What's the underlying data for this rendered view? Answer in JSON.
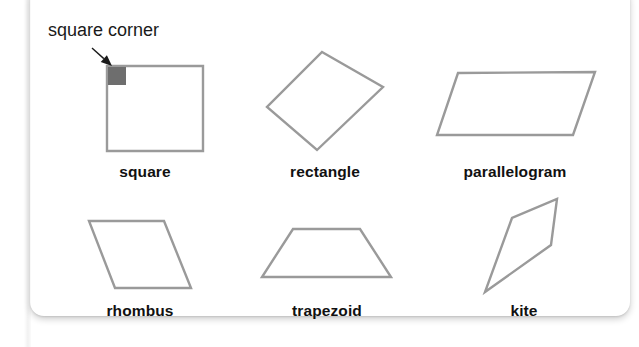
{
  "page": {
    "background_color": "#ffffff",
    "card_color": "#ffffff"
  },
  "style": {
    "shape_stroke_color": "#9a9a9a",
    "shape_fill_color": "#ffffff",
    "corner_marker_color": "#6e6e6e",
    "label_color": "#111111",
    "annotation_color": "#1a1a1a"
  },
  "annotation": {
    "text": "square corner",
    "x": 48,
    "y": 20,
    "arrow_start_x": 92,
    "arrow_start_y": 48,
    "arrow_end_x": 112,
    "arrow_end_y": 66
  },
  "shapes": [
    {
      "id": "square",
      "label": "square",
      "label_x": 145,
      "label_y": 163,
      "points": "107,66 203,66 203,151 107,151",
      "has_corner_marker": true,
      "corner_marker": {
        "x": 108,
        "y": 67,
        "width": 18,
        "height": 18
      }
    },
    {
      "id": "rectangle",
      "label": "rectangle",
      "label_x": 325,
      "label_y": 163,
      "points": "322,52 383,87 317,150 267,107",
      "has_corner_marker": false
    },
    {
      "id": "parallelogram",
      "label": "parallelogram",
      "label_x": 515,
      "label_y": 163,
      "points": "458,73 595,72 573,135 437,135",
      "has_corner_marker": false
    },
    {
      "id": "rhombus",
      "label": "rhombus",
      "label_x": 140,
      "label_y": 302,
      "points": "89,221 164,221 191,288 115,288",
      "has_corner_marker": false
    },
    {
      "id": "trapezoid",
      "label": "trapezoid",
      "label_x": 327,
      "label_y": 302,
      "points": "293,229 360,229 391,277 262,277",
      "has_corner_marker": false
    },
    {
      "id": "kite",
      "label": "kite",
      "label_x": 524,
      "label_y": 302,
      "points": "557,199 551,245 485,292 512,218",
      "has_corner_marker": false
    }
  ]
}
